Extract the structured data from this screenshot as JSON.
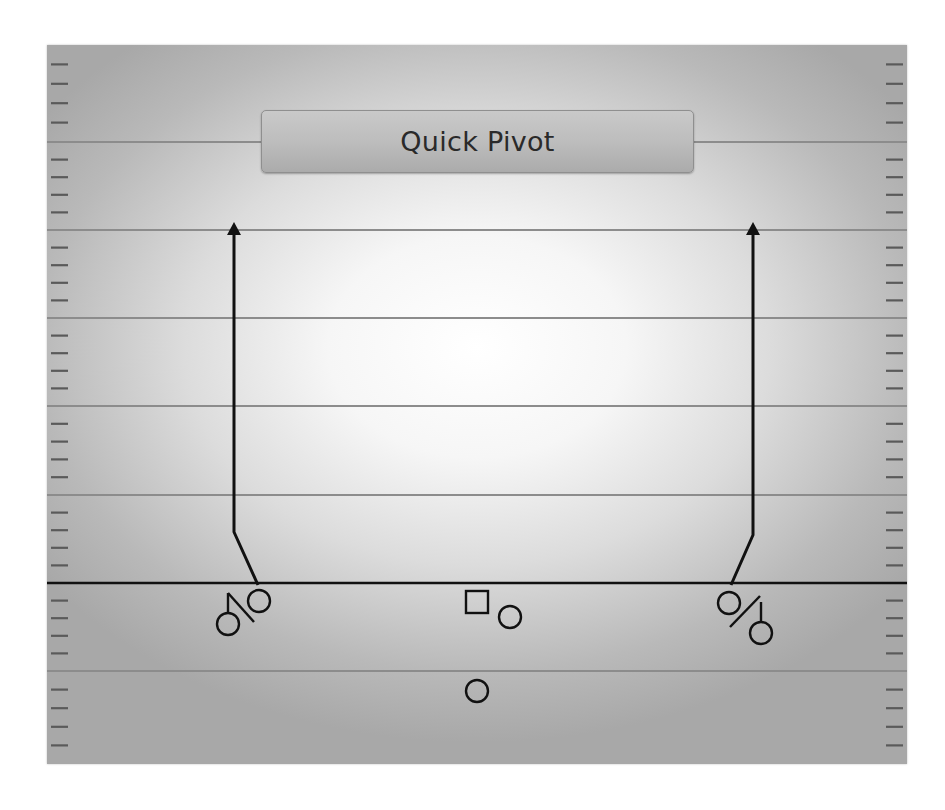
{
  "play": {
    "title": "Quick Pivot"
  },
  "field": {
    "bounds": {
      "x": 47,
      "y": 45,
      "width": 860,
      "height": 719
    },
    "yard_lines_y": [
      142,
      230,
      318,
      406,
      495,
      671
    ],
    "line_of_scrimmage_y": 583,
    "hash_marks_per_gap": 4,
    "colors": {
      "yard_line": "#8c8c8c",
      "line_of_scrimmage": "#111111",
      "hash": "#5a5a5a",
      "ink": "#111111"
    }
  },
  "players": [
    {
      "id": "left-receiver",
      "shape": "circle",
      "cx": 259,
      "cy": 601,
      "r": 11
    },
    {
      "id": "left-slot",
      "shape": "circle",
      "cx": 228,
      "cy": 624,
      "r": 11,
      "stem": true
    },
    {
      "id": "center",
      "shape": "square",
      "x": 466,
      "y": 591,
      "size": 22
    },
    {
      "id": "right-guard",
      "shape": "circle",
      "cx": 510,
      "cy": 617,
      "r": 11
    },
    {
      "id": "quarterback",
      "shape": "circle",
      "cx": 477,
      "cy": 691,
      "r": 11
    },
    {
      "id": "right-receiver",
      "shape": "circle",
      "cx": 729,
      "cy": 603,
      "r": 11
    },
    {
      "id": "right-slot",
      "shape": "circle",
      "cx": 761,
      "cy": 633,
      "r": 11,
      "stem": true
    }
  ],
  "routes": [
    {
      "id": "left-route",
      "points": [
        [
          258,
          585
        ],
        [
          234,
          532
        ],
        [
          234,
          232
        ]
      ],
      "arrow_tip": [
        234,
        222
      ]
    },
    {
      "id": "right-route",
      "points": [
        [
          731,
          585
        ],
        [
          753,
          535
        ],
        [
          753,
          232
        ]
      ],
      "arrow_tip": [
        753,
        222
      ]
    }
  ],
  "marks": [
    {
      "id": "left-block-mark",
      "from": [
        228,
        593
      ],
      "to": [
        254,
        622
      ]
    },
    {
      "id": "right-block-mark",
      "from": [
        760,
        596
      ],
      "to": [
        730,
        627
      ]
    }
  ]
}
